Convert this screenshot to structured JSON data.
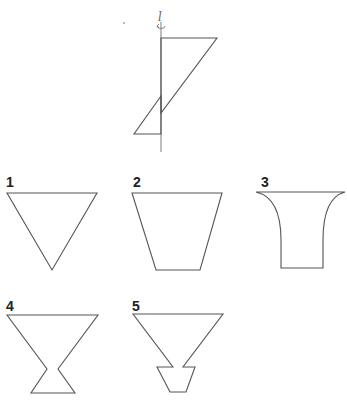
{
  "figure": {
    "axis_label": "l",
    "rotation_icon": "rotation-arrow-icon",
    "colors": {
      "stroke": "#555555",
      "axis": "#888888",
      "label": "#222222"
    }
  },
  "options": [
    {
      "label": "1",
      "shape": "inverted-triangle"
    },
    {
      "label": "2",
      "shape": "inverted-trapezoid"
    },
    {
      "label": "3",
      "shape": "flared-vase"
    },
    {
      "label": "4",
      "shape": "hourglass-goblet"
    },
    {
      "label": "5",
      "shape": "funnel-with-base"
    }
  ]
}
